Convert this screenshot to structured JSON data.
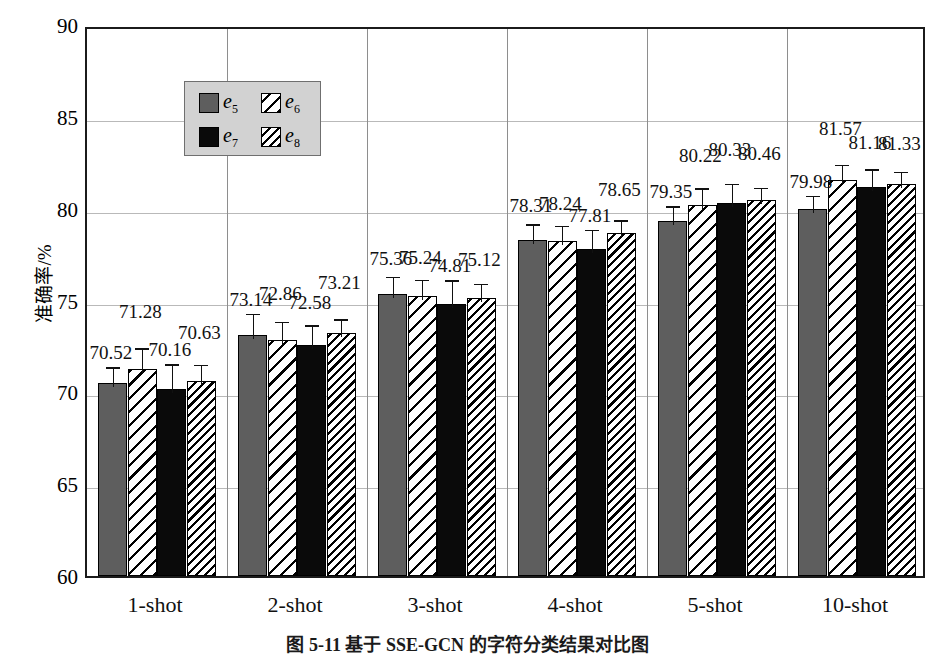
{
  "chart_data": {
    "type": "bar",
    "title": "",
    "xlabel": "",
    "ylabel": "准确率/%",
    "ylim": [
      60,
      90
    ],
    "ytick_step": 5,
    "yticks": [
      60,
      65,
      70,
      75,
      80,
      85,
      90
    ],
    "grid": "horizontal-and-vertical",
    "legend_position": "upper-left-inside",
    "categories": [
      "1-shot",
      "2-shot",
      "3-shot",
      "4-shot",
      "5-shot",
      "10-shot"
    ],
    "series": [
      {
        "name": "e5",
        "label_base": "e",
        "label_sub": "5",
        "fill": "solid-gray",
        "color": "#5e5e5e",
        "values": [
          70.52,
          73.14,
          75.36,
          78.31,
          79.35,
          79.98
        ],
        "errors": [
          1.05,
          1.35,
          1.15,
          1.05,
          1.0,
          0.95
        ]
      },
      {
        "name": "e6",
        "label_base": "e",
        "label_sub": "6",
        "fill": "hatch-sparse",
        "color": "#ffffff",
        "values": [
          71.28,
          72.86,
          75.24,
          78.24,
          80.22,
          81.57
        ],
        "errors": [
          1.35,
          1.2,
          1.1,
          1.05,
          1.1,
          1.05
        ]
      },
      {
        "name": "e7",
        "label_base": "e",
        "label_sub": "7",
        "fill": "solid-black",
        "color": "#0a0a0a",
        "values": [
          70.16,
          72.58,
          74.81,
          77.81,
          80.33,
          81.16
        ],
        "errors": [
          1.6,
          1.3,
          1.5,
          1.25,
          1.25,
          1.2
        ]
      },
      {
        "name": "e8",
        "label_base": "e",
        "label_sub": "8",
        "fill": "hatch-dense",
        "color": "#ffffff",
        "values": [
          70.63,
          73.21,
          75.12,
          78.65,
          80.46,
          81.33
        ],
        "errors": [
          1.1,
          1.0,
          1.0,
          0.95,
          0.9,
          0.9
        ]
      }
    ]
  },
  "caption": "图 5-11  基于 SSE-GCN 的字符分类结果对比图"
}
